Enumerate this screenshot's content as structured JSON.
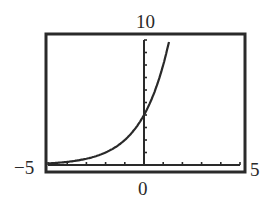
{
  "chart_data": {
    "type": "line",
    "title": "",
    "xlabel": "",
    "ylabel": "",
    "xlim": [
      -5,
      5
    ],
    "ylim": [
      0,
      10
    ],
    "xtick_step": 1,
    "ytick_step": 1,
    "grid": false,
    "legend": null,
    "window_labels": {
      "ymax": "10",
      "xmin": "−5",
      "xmax": "5",
      "ymin": "0"
    },
    "series": [
      {
        "name": "y = 4·2^x",
        "x": [
          -5,
          -4,
          -3,
          -2,
          -1,
          0,
          0.5,
          1,
          1.32
        ],
        "y": [
          0.125,
          0.25,
          0.5,
          1,
          2,
          4,
          5.66,
          8,
          10
        ]
      }
    ],
    "colors": {
      "axes": "#2a2a2a",
      "curve": "#2a2a2a",
      "frame": "#2a2a2a",
      "background": "#ffffff"
    }
  }
}
